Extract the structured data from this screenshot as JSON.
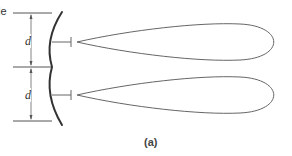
{
  "figure": {
    "top_left_label_fragment": "le",
    "caption": "(a)",
    "dimension_labels": [
      "d",
      "d"
    ],
    "colors": {
      "stroke": "#555555",
      "reflector": "#333333",
      "background": "#ffffff"
    },
    "feeds": [
      {
        "y": 42,
        "lobe_length": 210
      },
      {
        "y": 95,
        "lobe_length": 210
      }
    ]
  }
}
